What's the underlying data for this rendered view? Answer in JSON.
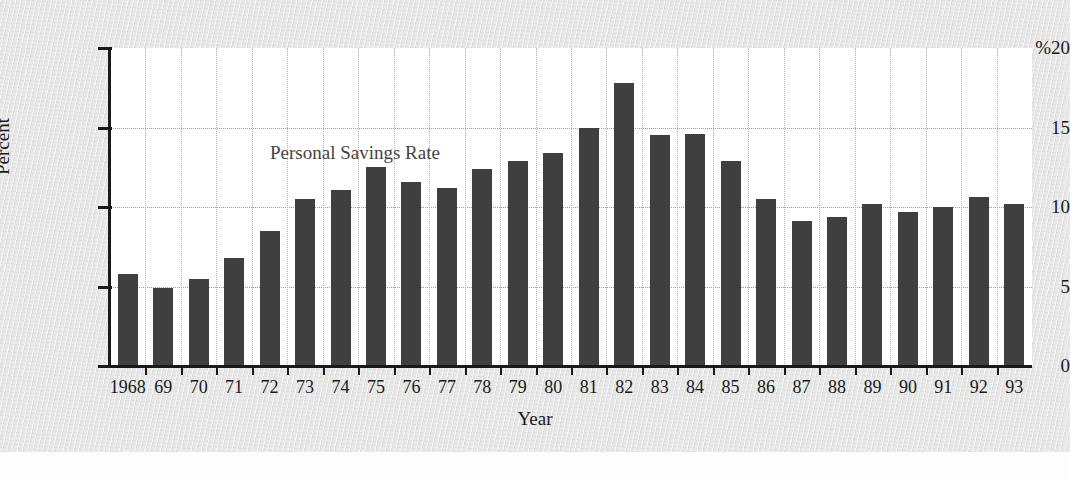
{
  "chart_data": {
    "type": "bar",
    "title": "Personal Savings Rate",
    "xlabel": "Year",
    "ylabel": "Percent",
    "y_unit_prefix": "%",
    "ylim": [
      0,
      20
    ],
    "yticks": [
      0,
      5,
      10,
      15,
      20
    ],
    "ytick_labels": [
      "0",
      "5",
      "10",
      "15",
      "%20"
    ],
    "grid": "horizontal-and-vertical-dotted",
    "legend": "none",
    "categories": [
      "1968",
      "69",
      "70",
      "71",
      "72",
      "73",
      "74",
      "75",
      "76",
      "77",
      "78",
      "79",
      "80",
      "81",
      "82",
      "83",
      "84",
      "85",
      "86",
      "87",
      "88",
      "89",
      "90",
      "91",
      "92",
      "93"
    ],
    "values": [
      5.8,
      4.9,
      5.5,
      6.8,
      8.5,
      10.5,
      11.1,
      12.5,
      11.6,
      11.2,
      12.4,
      12.9,
      13.4,
      15.0,
      17.8,
      14.5,
      14.6,
      12.9,
      10.5,
      9.1,
      9.4,
      10.2,
      9.7,
      10.0,
      10.6,
      10.2
    ],
    "bar_color": "#3f3f3f"
  }
}
